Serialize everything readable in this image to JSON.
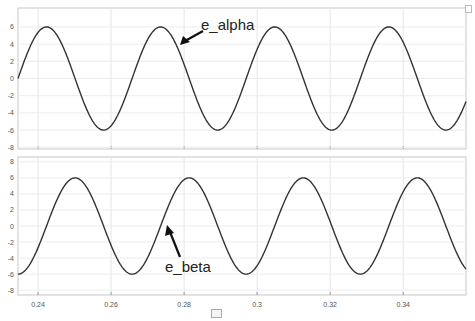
{
  "chart_data": [
    {
      "type": "line",
      "title": "",
      "xlabel": "",
      "ylabel": "",
      "xlim": [
        0.2345,
        0.3572
      ],
      "ylim": [
        -8.2,
        8.2
      ],
      "grid": true,
      "x_ticks": [
        0.24,
        0.26,
        0.28,
        0.3,
        0.32,
        0.34
      ],
      "y_ticks": [
        6,
        4,
        2,
        0,
        -2,
        -4,
        -6,
        -8
      ],
      "y_tick_labels": [
        "6",
        "4",
        "2",
        "0",
        "-2",
        "-4",
        "-6",
        "-8"
      ],
      "series": [
        {
          "name": "e_alpha",
          "function": "6*sin(2*pi*32*(t-0.2345))",
          "amplitude": 6,
          "frequency_hz": 32,
          "phase_start": "sin",
          "color": "#333333"
        }
      ],
      "annotations": [
        {
          "text": "e_alpha",
          "arrow": true
        }
      ]
    },
    {
      "type": "line",
      "title": "",
      "xlabel": "",
      "ylabel": "",
      "xlim": [
        0.2345,
        0.3572
      ],
      "ylim": [
        -8.6,
        8.6
      ],
      "grid": true,
      "x_ticks": [
        0.24,
        0.26,
        0.28,
        0.3,
        0.32,
        0.34
      ],
      "x_tick_labels": [
        "0.24",
        "0.26",
        "0.28",
        "0.3",
        "0.32",
        "0.34"
      ],
      "y_ticks": [
        8,
        6,
        4,
        2,
        0,
        -2,
        -4,
        -6,
        -8
      ],
      "y_tick_labels": [
        "8",
        "6",
        "4",
        "2",
        "0",
        "-2",
        "-4",
        "-6",
        "-8"
      ],
      "series": [
        {
          "name": "e_beta",
          "function": "-6*cos(2*pi*32*(t-0.2345))",
          "amplitude": 6,
          "frequency_hz": 32,
          "phase_start": "-cos",
          "color": "#333333"
        }
      ],
      "annotations": [
        {
          "text": "e_beta",
          "arrow": true
        }
      ]
    }
  ],
  "labels": {
    "alpha": "e_alpha",
    "beta": "e_beta"
  },
  "legend": {
    "text": " "
  }
}
